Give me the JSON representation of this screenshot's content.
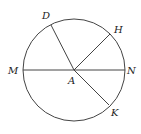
{
  "diagram": {
    "type": "circle-with-radii",
    "center": {
      "label": "A",
      "x": 74,
      "y": 70,
      "lx": 68,
      "ly": 84
    },
    "radius": 51,
    "points": [
      {
        "label": "D",
        "x": 51,
        "y": 25,
        "lx": 42,
        "ly": 19
      },
      {
        "label": "H",
        "x": 110,
        "y": 34,
        "lx": 114,
        "ly": 33
      },
      {
        "label": "M",
        "x": 23,
        "y": 70,
        "lx": 8,
        "ly": 74
      },
      {
        "label": "N",
        "x": 125,
        "y": 70,
        "lx": 127,
        "ly": 74
      },
      {
        "label": "K",
        "x": 109,
        "y": 105,
        "lx": 111,
        "ly": 116
      }
    ],
    "segments": [
      {
        "from": "M",
        "to": "N",
        "name": "diameter-MN"
      },
      {
        "from": "A",
        "to": "D",
        "name": "radius-AD"
      },
      {
        "from": "A",
        "to": "H",
        "name": "radius-AH"
      },
      {
        "from": "A",
        "to": "K",
        "name": "radius-AK"
      }
    ],
    "colors": {
      "stroke": "#444444",
      "text": "#222222"
    }
  }
}
